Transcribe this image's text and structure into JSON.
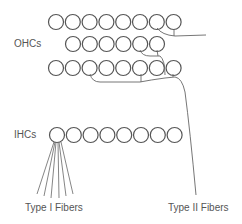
{
  "labels": {
    "ohcs": "OHCs",
    "ihcs": "IHCs",
    "type1": "Type I Fibers",
    "type2": "Type II Fibers"
  },
  "rows": [
    {
      "name": "ohc-row-1",
      "count": 8,
      "x0": 56,
      "y": 22
    },
    {
      "name": "ohc-row-2",
      "count": 6,
      "x0": 73,
      "y": 44
    },
    {
      "name": "ohc-row-3",
      "count": 8,
      "x0": 56,
      "y": 68
    },
    {
      "name": "ihc-row",
      "count": 8,
      "x0": 57,
      "y": 135
    }
  ],
  "style": {
    "stroke": "#555555",
    "radius": 7.5,
    "spacing": 16.8
  }
}
